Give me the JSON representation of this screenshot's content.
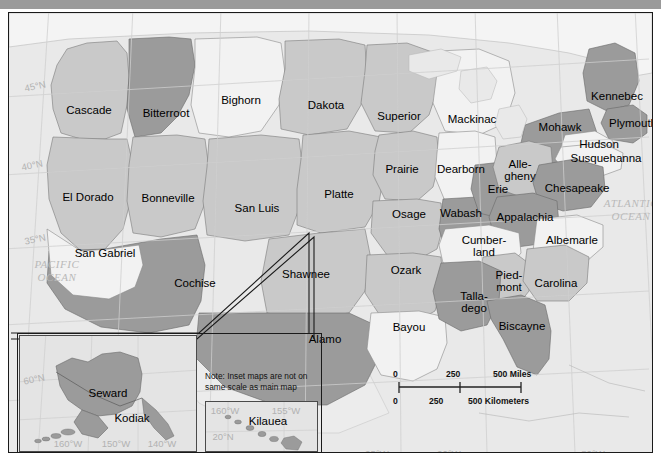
{
  "map": {
    "title": "United States Regions Map",
    "frame_border_color": "#1a1a1a",
    "ocean_color": "#e9e9e9",
    "shades": {
      "light": "#f2f2f2",
      "medium": "#c9c9c9",
      "dark": "#9b9b9b"
    },
    "graticule_color": "#b2b2b2",
    "ocean_labels": [
      {
        "name": "pacific-ocean",
        "line1": "PACIFIC",
        "line2": "OCEAN",
        "x": 48,
        "y": 258
      },
      {
        "name": "atlantic-ocean",
        "line1": "ATLANTIC",
        "line2": "OCEAN",
        "x": 622,
        "y": 197
      }
    ],
    "graticule_labels": [
      {
        "text": "45°N",
        "x": 26,
        "y": 73,
        "rotated": true
      },
      {
        "text": "40°N",
        "x": 23,
        "y": 152,
        "rotated": true
      },
      {
        "text": "35°N",
        "x": 26,
        "y": 226,
        "rotated": true
      },
      {
        "text": "95°W",
        "x": 368,
        "y": 440,
        "rotated": false
      },
      {
        "text": "90°W",
        "x": 440,
        "y": 440,
        "rotated": false
      },
      {
        "text": "80°W",
        "x": 584,
        "y": 440,
        "rotated": false
      }
    ],
    "regions": [
      {
        "label": "Cascade",
        "x": 80,
        "y": 98,
        "shade": "medium"
      },
      {
        "label": "Bitterroot",
        "x": 157,
        "y": 101,
        "shade": "dark"
      },
      {
        "label": "Bighorn",
        "x": 232,
        "y": 88,
        "shade": "light"
      },
      {
        "label": "Dakota",
        "x": 317,
        "y": 93,
        "shade": "medium"
      },
      {
        "label": "Superior",
        "x": 390,
        "y": 104,
        "shade": "medium"
      },
      {
        "label": "Mackinac",
        "x": 463,
        "y": 107,
        "shade": "light"
      },
      {
        "label": "Mohawk",
        "x": 551,
        "y": 115,
        "shade": "dark"
      },
      {
        "label": "Kennebec",
        "x": 608,
        "y": 84,
        "shade": "dark"
      },
      {
        "label": "Plymouth",
        "x": 624,
        "y": 111,
        "shade": "dark"
      },
      {
        "label": "Hudson",
        "x": 590,
        "y": 132,
        "shade": "light"
      },
      {
        "label": "Susquehanna",
        "x": 597,
        "y": 146,
        "shade": "light"
      },
      {
        "label": "El Dorado",
        "x": 79,
        "y": 185,
        "shade": "medium"
      },
      {
        "label": "Bonneville",
        "x": 159,
        "y": 186,
        "shade": "medium"
      },
      {
        "label": "San Luis",
        "x": 248,
        "y": 196,
        "shade": "medium"
      },
      {
        "label": "Platte",
        "x": 330,
        "y": 182,
        "shade": "medium"
      },
      {
        "label": "Prairie",
        "x": 393,
        "y": 157,
        "shade": "medium"
      },
      {
        "label": "Dearborn",
        "x": 452,
        "y": 157,
        "shade": "light"
      },
      {
        "label": "Alle-",
        "x": 511,
        "y": 157,
        "shade": "medium",
        "line2": "gheny",
        "two_line": true
      },
      {
        "label": "Erie",
        "x": 489,
        "y": 177,
        "shade": "dark"
      },
      {
        "label": "Chesapeake",
        "x": 568,
        "y": 176,
        "shade": "dark"
      },
      {
        "label": "Osage",
        "x": 400,
        "y": 202,
        "shade": "medium"
      },
      {
        "label": "Wabash",
        "x": 452,
        "y": 201,
        "shade": "dark"
      },
      {
        "label": "Appalachia",
        "x": 516,
        "y": 205,
        "shade": "dark"
      },
      {
        "label": "Albemarle",
        "x": 563,
        "y": 228,
        "shade": "light"
      },
      {
        "label": "San Gabriel",
        "x": 96,
        "y": 241,
        "shade": "light"
      },
      {
        "label": "Cochise",
        "x": 186,
        "y": 271,
        "shade": "dark"
      },
      {
        "label": "Shawnee",
        "x": 297,
        "y": 262,
        "shade": "medium"
      },
      {
        "label": "Ozark",
        "x": 397,
        "y": 258,
        "shade": "medium"
      },
      {
        "label": "Cumber-",
        "x": 475,
        "y": 233,
        "shade": "light",
        "line2": "land",
        "two_line": true
      },
      {
        "label": "Pied-",
        "x": 500,
        "y": 268,
        "shade": "medium",
        "line2": "mont",
        "two_line": true
      },
      {
        "label": "Carolina",
        "x": 547,
        "y": 271,
        "shade": "medium"
      },
      {
        "label": "Talla-",
        "x": 465,
        "y": 289,
        "shade": "dark",
        "line2": "dego",
        "two_line": true
      },
      {
        "label": "Biscayne",
        "x": 513,
        "y": 314,
        "shade": "dark"
      },
      {
        "label": "Bayou",
        "x": 400,
        "y": 315,
        "shade": "light"
      },
      {
        "label": "Alamo",
        "x": 316,
        "y": 327,
        "shade": "dark"
      }
    ],
    "scalebar": {
      "miles_ticks": [
        "0",
        "250",
        "500 Miles"
      ],
      "km_ticks": [
        "0",
        "250",
        "500 Kilometers"
      ]
    },
    "note": "Note: Inset maps are not on same scale as main map",
    "insets": [
      {
        "name": "alaska",
        "regions": [
          {
            "label": "Seward",
            "x": 88,
            "y": 58,
            "shade": "dark"
          },
          {
            "label": "Kodiak",
            "x": 112,
            "y": 83,
            "shade": "dark"
          }
        ],
        "graticule_labels": [
          {
            "text": "60°N",
            "x": 14,
            "y": 43,
            "rotated": true
          },
          {
            "text": "160°W",
            "x": 48,
            "y": 107,
            "rotated": false
          },
          {
            "text": "150°W",
            "x": 96,
            "y": 107,
            "rotated": false
          },
          {
            "text": "140°W",
            "x": 142,
            "y": 107,
            "rotated": false
          }
        ]
      },
      {
        "name": "hawaii",
        "regions": [
          {
            "label": "Kilauea",
            "x": 62,
            "y": 20,
            "shade": "dark"
          }
        ],
        "graticule_labels": [
          {
            "text": "160°W",
            "x": 19,
            "y": 8,
            "rotated": false
          },
          {
            "text": "155°W",
            "x": 80,
            "y": 8,
            "rotated": false
          },
          {
            "text": "20°N",
            "x": 17,
            "y": 34,
            "rotated": false
          }
        ]
      }
    ]
  }
}
